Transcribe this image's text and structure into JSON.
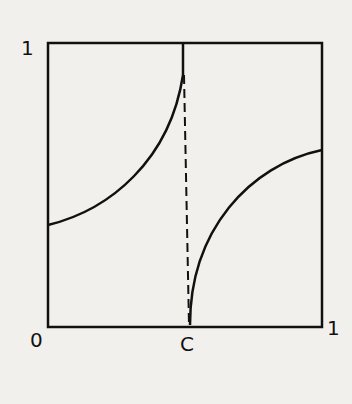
{
  "diagram": {
    "type": "unit-square-with-curves",
    "labels": {
      "y_top": "1",
      "origin": "0",
      "c_point": "C",
      "x_right": "1"
    },
    "elements": [
      {
        "kind": "square",
        "from": [
          0,
          0
        ],
        "to": [
          1,
          1
        ]
      },
      {
        "kind": "curve",
        "description": "increasing concave-up curve from left edge (~0.36) up to top at x=C"
      },
      {
        "kind": "curve",
        "description": "increasing concave-down curve from (C,0) to right edge (~0.63)"
      },
      {
        "kind": "dashed-line",
        "description": "near-vertical dashed line from top at x=C down to C on the x-axis"
      }
    ],
    "colors": {
      "ink": "#111111",
      "paper": "#f1f0ed"
    }
  }
}
